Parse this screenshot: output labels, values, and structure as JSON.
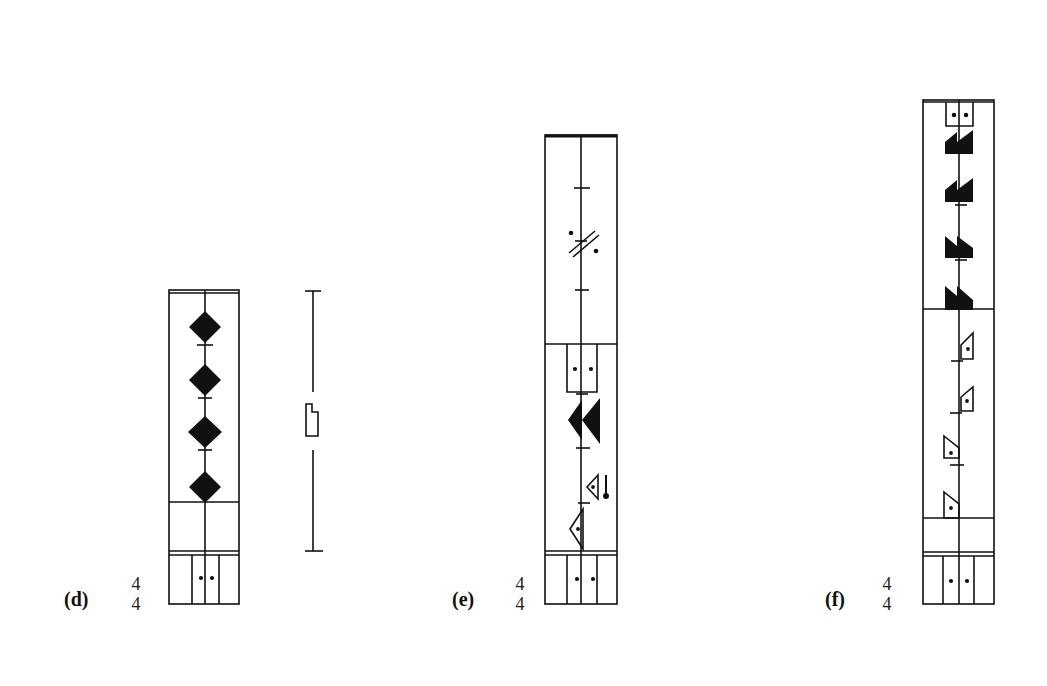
{
  "figure": {
    "type": "labanotation-staff-examples",
    "panels": [
      {
        "label": "(d)",
        "time_signature": {
          "top": "4",
          "bottom": "4"
        },
        "symbols": [
          "direction-diamond-filled x4",
          "hold/bracket with body-part sign"
        ]
      },
      {
        "label": "(e)",
        "time_signature": {
          "top": "4",
          "bottom": "4"
        },
        "symbols": [
          "repeat/hold sign with dots",
          "start position dots",
          "double filled direction",
          "open direction with pin",
          "open direction"
        ]
      },
      {
        "label": "(f)",
        "time_signature": {
          "top": "4",
          "bottom": "4"
        },
        "symbols": [
          "start position dots",
          "filled forward-diagonal x4",
          "open diagonal-with-dot x4"
        ]
      }
    ]
  },
  "colors": {
    "ink": "#111111",
    "paper": "#ffffff"
  }
}
